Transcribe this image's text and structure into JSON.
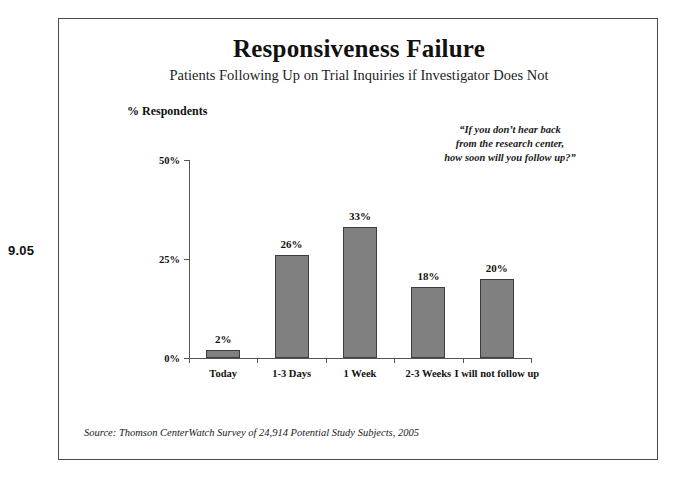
{
  "figure": {
    "number": "9.05"
  },
  "header": {
    "title": "Responsiveness Failure",
    "subtitle": "Patients Following Up on Trial Inquiries if Investigator Does Not"
  },
  "callout": {
    "line1": "“If you don’t hear back",
    "line2": "from the research center,",
    "line3": "how soon will you follow up?”"
  },
  "axis": {
    "y_caption": "% Respondents",
    "y_ticks": [
      "50%",
      "25%",
      "0%"
    ]
  },
  "source": {
    "text": "Source: Thomson CenterWatch Survey of 24,914 Potential Study Subjects, 2005"
  },
  "colors": {
    "bar_fill": "#808080",
    "bar_stroke": "#3d3d3d",
    "axis": "#555555",
    "frame": "#4a4a4a",
    "text": "#111111"
  },
  "chart_data": {
    "type": "bar",
    "title": "Responsiveness Failure",
    "subtitle": "Patients Following Up on Trial Inquiries if Investigator Does Not",
    "xlabel": "",
    "ylabel": "% Respondents",
    "ylim": [
      0,
      50
    ],
    "yticks": [
      0,
      25,
      50
    ],
    "ytick_labels": [
      "0%",
      "25%",
      "50%"
    ],
    "grid": false,
    "legend": null,
    "categories": [
      "Today",
      "1-3 Days",
      "1 Week",
      "2-3 Weeks",
      "I will not follow up"
    ],
    "values": [
      2,
      26,
      33,
      18,
      20
    ],
    "data_labels": [
      "2%",
      "26%",
      "33%",
      "18%",
      "20%"
    ],
    "annotation": "“If you don’t hear back from the research center, how soon will you follow up?”",
    "source": "Source: Thomson CenterWatch Survey of 24,914 Potential Study Subjects, 2005"
  }
}
